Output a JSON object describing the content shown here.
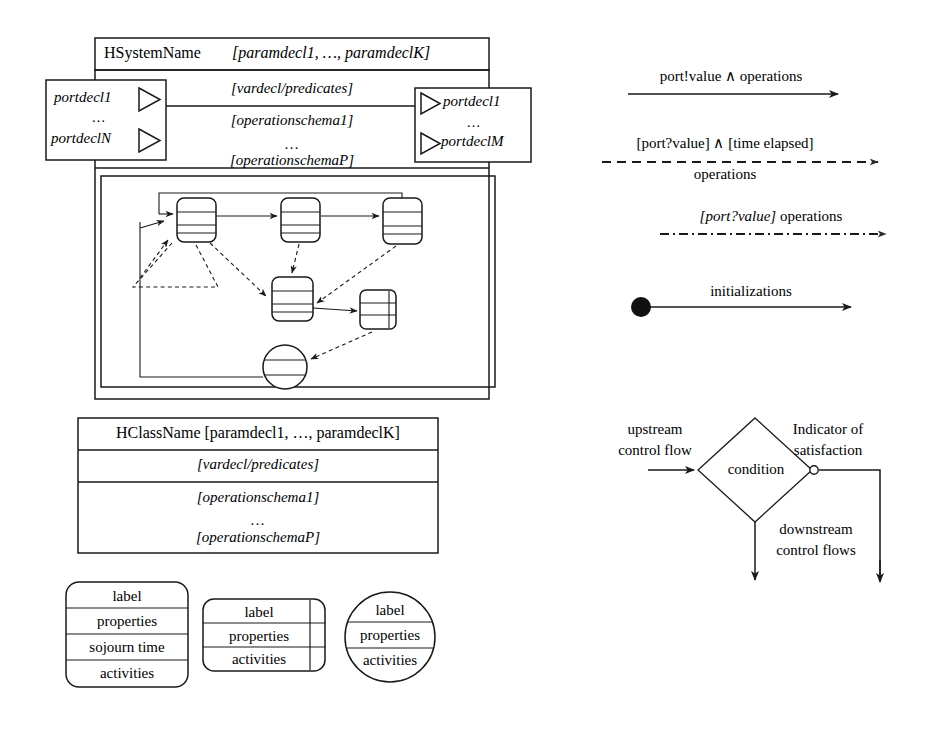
{
  "system_box": {
    "header": {
      "name": "HSystemName",
      "params": "[paramdecl1, …, paramdeclK]"
    },
    "rows": [
      "[vardecl/predicates]",
      "[operationschema1]",
      "…",
      "[operationschemaP]"
    ],
    "left_ports": {
      "first": "portdecl1",
      "ellipsis": "…",
      "last": "portdeclN",
      "arrow_icon": "triangle-right-icon"
    },
    "right_ports": {
      "first": "portdecl1",
      "ellipsis": "…",
      "last": "portdeclM",
      "arrow_icon": "triangle-right-icon"
    }
  },
  "statechart": {
    "states": [
      {
        "id": "s1",
        "shape": "rounded-rect"
      },
      {
        "id": "s2",
        "shape": "rounded-rect"
      },
      {
        "id": "s3",
        "shape": "rounded-rect"
      },
      {
        "id": "s4",
        "shape": "rounded-rect"
      },
      {
        "id": "s5",
        "shape": "rounded-rect-with-side-bar"
      },
      {
        "id": "s6",
        "shape": "circle"
      }
    ]
  },
  "class_box": {
    "header": "HClassName [paramdecl1, …, paramdeclK]",
    "rows": [
      "[vardecl/predicates]",
      "[operationschema1]",
      "…",
      "[operationschemaP]"
    ]
  },
  "state_legend": {
    "wide": {
      "label": "label",
      "properties": "properties",
      "sojourn": "sojourn time",
      "activities": "activities"
    },
    "medium": {
      "label": "label",
      "properties": "properties",
      "activities": "activities"
    },
    "circle": {
      "label": "label",
      "properties": "properties",
      "activities": "activities"
    }
  },
  "arrow_legend": [
    {
      "id": "solid-arrow",
      "above": "port!value ∧ operations",
      "below": "",
      "style": "solid"
    },
    {
      "id": "dashed-arrow",
      "above": "[port?value] ∧ [time elapsed]",
      "below": "operations",
      "style": "dashed"
    },
    {
      "id": "dash-dot-arrow",
      "above": "[port?value] operations",
      "below": "",
      "style": "dash-dot"
    },
    {
      "id": "initialization-arrow",
      "above": "initializations",
      "below": "",
      "style": "solid-with-filled-dot"
    }
  ],
  "decision_legend": {
    "upstream_line1": "upstream",
    "upstream_line2": "control flow",
    "condition": "condition",
    "indicator_line1": "Indicator of",
    "indicator_line2": "satisfaction",
    "downstream_line1": "downstream",
    "downstream_line2": "control flows"
  },
  "colors": {
    "ink": "#000000",
    "paper": "#ffffff"
  }
}
